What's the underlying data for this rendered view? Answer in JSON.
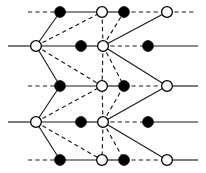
{
  "figure": {
    "width": 206,
    "height": 173,
    "background_color": "#ffffff",
    "line_color": "#1a1a1a",
    "filled_node_color": "#000000",
    "open_node_color": "#ffffff"
  },
  "chart_data": {
    "type": "diagram",
    "subtype": "graph-lattice",
    "grid": false,
    "legend": null,
    "node_radius_filled": 5.4,
    "node_radius_open": 5.4,
    "rows_y": [
      12,
      46,
      86,
      122,
      160
    ],
    "columns_x": [
      36,
      60,
      102,
      124,
      167
    ],
    "nodes": [
      {
        "id": "n1",
        "x": 60,
        "y": 12,
        "type": "filled"
      },
      {
        "id": "n2",
        "x": 102,
        "y": 12,
        "type": "open"
      },
      {
        "id": "n3",
        "x": 124,
        "y": 12,
        "type": "filled"
      },
      {
        "id": "n4",
        "x": 167,
        "y": 12,
        "type": "open"
      },
      {
        "id": "n5",
        "x": 36,
        "y": 46,
        "type": "open"
      },
      {
        "id": "n6",
        "x": 81,
        "y": 46,
        "type": "filled"
      },
      {
        "id": "n7",
        "x": 103,
        "y": 46,
        "type": "open"
      },
      {
        "id": "n8",
        "x": 148,
        "y": 46,
        "type": "filled"
      },
      {
        "id": "n9",
        "x": 60,
        "y": 86,
        "type": "filled"
      },
      {
        "id": "n10",
        "x": 102,
        "y": 86,
        "type": "open"
      },
      {
        "id": "n11",
        "x": 124,
        "y": 86,
        "type": "filled"
      },
      {
        "id": "n12",
        "x": 167,
        "y": 86,
        "type": "open"
      },
      {
        "id": "n13",
        "x": 36,
        "y": 122,
        "type": "open"
      },
      {
        "id": "n14",
        "x": 81,
        "y": 122,
        "type": "filled"
      },
      {
        "id": "n15",
        "x": 103,
        "y": 122,
        "type": "open"
      },
      {
        "id": "n16",
        "x": 148,
        "y": 122,
        "type": "filled"
      },
      {
        "id": "n17",
        "x": 60,
        "y": 160,
        "type": "filled"
      },
      {
        "id": "n18",
        "x": 102,
        "y": 160,
        "type": "open"
      },
      {
        "id": "n19",
        "x": 124,
        "y": 160,
        "type": "filled"
      },
      {
        "id": "n20",
        "x": 167,
        "y": 160,
        "type": "open"
      }
    ],
    "edges": [
      {
        "x1": 28,
        "y1": 12,
        "x2": 60,
        "y2": 12,
        "style": "dashed"
      },
      {
        "x1": 60,
        "y1": 12,
        "x2": 102,
        "y2": 12,
        "style": "solid"
      },
      {
        "x1": 102,
        "y1": 12,
        "x2": 124,
        "y2": 12,
        "style": "solid"
      },
      {
        "x1": 124,
        "y1": 12,
        "x2": 167,
        "y2": 12,
        "style": "dashed"
      },
      {
        "x1": 167,
        "y1": 12,
        "x2": 196,
        "y2": 12,
        "style": "dashed"
      },
      {
        "x1": 8,
        "y1": 46,
        "x2": 36,
        "y2": 46,
        "style": "solid"
      },
      {
        "x1": 36,
        "y1": 46,
        "x2": 81,
        "y2": 46,
        "style": "solid"
      },
      {
        "x1": 81,
        "y1": 46,
        "x2": 103,
        "y2": 46,
        "style": "solid"
      },
      {
        "x1": 103,
        "y1": 46,
        "x2": 148,
        "y2": 46,
        "style": "dashed"
      },
      {
        "x1": 148,
        "y1": 46,
        "x2": 198,
        "y2": 46,
        "style": "solid"
      },
      {
        "x1": 28,
        "y1": 86,
        "x2": 60,
        "y2": 86,
        "style": "dashed"
      },
      {
        "x1": 60,
        "y1": 86,
        "x2": 102,
        "y2": 86,
        "style": "solid"
      },
      {
        "x1": 102,
        "y1": 86,
        "x2": 124,
        "y2": 86,
        "style": "solid"
      },
      {
        "x1": 124,
        "y1": 86,
        "x2": 167,
        "y2": 86,
        "style": "dashed"
      },
      {
        "x1": 167,
        "y1": 86,
        "x2": 198,
        "y2": 86,
        "style": "solid"
      },
      {
        "x1": 8,
        "y1": 122,
        "x2": 36,
        "y2": 122,
        "style": "solid"
      },
      {
        "x1": 36,
        "y1": 122,
        "x2": 81,
        "y2": 122,
        "style": "solid"
      },
      {
        "x1": 81,
        "y1": 122,
        "x2": 103,
        "y2": 122,
        "style": "solid"
      },
      {
        "x1": 103,
        "y1": 122,
        "x2": 148,
        "y2": 122,
        "style": "dashed"
      },
      {
        "x1": 148,
        "y1": 122,
        "x2": 198,
        "y2": 122,
        "style": "solid"
      },
      {
        "x1": 28,
        "y1": 160,
        "x2": 60,
        "y2": 160,
        "style": "dashed"
      },
      {
        "x1": 60,
        "y1": 160,
        "x2": 102,
        "y2": 160,
        "style": "solid"
      },
      {
        "x1": 102,
        "y1": 160,
        "x2": 124,
        "y2": 160,
        "style": "solid"
      },
      {
        "x1": 124,
        "y1": 160,
        "x2": 167,
        "y2": 160,
        "style": "dashed"
      },
      {
        "x1": 167,
        "y1": 160,
        "x2": 198,
        "y2": 160,
        "style": "solid"
      },
      {
        "x1": 36,
        "y1": 46,
        "x2": 60,
        "y2": 12,
        "style": "solid"
      },
      {
        "x1": 36,
        "y1": 46,
        "x2": 102,
        "y2": 12,
        "style": "dashed"
      },
      {
        "x1": 36,
        "y1": 46,
        "x2": 60,
        "y2": 86,
        "style": "solid"
      },
      {
        "x1": 36,
        "y1": 46,
        "x2": 102,
        "y2": 86,
        "style": "dashed"
      },
      {
        "x1": 103,
        "y1": 46,
        "x2": 102,
        "y2": 12,
        "style": "dashed"
      },
      {
        "x1": 103,
        "y1": 46,
        "x2": 124,
        "y2": 12,
        "style": "dashed"
      },
      {
        "x1": 103,
        "y1": 46,
        "x2": 167,
        "y2": 12,
        "style": "solid"
      },
      {
        "x1": 103,
        "y1": 46,
        "x2": 102,
        "y2": 86,
        "style": "dashed"
      },
      {
        "x1": 103,
        "y1": 46,
        "x2": 124,
        "y2": 86,
        "style": "dashed"
      },
      {
        "x1": 103,
        "y1": 46,
        "x2": 167,
        "y2": 86,
        "style": "solid"
      },
      {
        "x1": 36,
        "y1": 122,
        "x2": 60,
        "y2": 86,
        "style": "solid"
      },
      {
        "x1": 36,
        "y1": 122,
        "x2": 102,
        "y2": 86,
        "style": "dashed"
      },
      {
        "x1": 36,
        "y1": 122,
        "x2": 60,
        "y2": 160,
        "style": "solid"
      },
      {
        "x1": 36,
        "y1": 122,
        "x2": 102,
        "y2": 160,
        "style": "dashed"
      },
      {
        "x1": 103,
        "y1": 122,
        "x2": 102,
        "y2": 86,
        "style": "dashed"
      },
      {
        "x1": 103,
        "y1": 122,
        "x2": 124,
        "y2": 86,
        "style": "dashed"
      },
      {
        "x1": 103,
        "y1": 122,
        "x2": 167,
        "y2": 86,
        "style": "solid"
      },
      {
        "x1": 103,
        "y1": 122,
        "x2": 102,
        "y2": 160,
        "style": "dashed"
      },
      {
        "x1": 103,
        "y1": 122,
        "x2": 124,
        "y2": 160,
        "style": "dashed"
      },
      {
        "x1": 103,
        "y1": 122,
        "x2": 167,
        "y2": 160,
        "style": "solid"
      }
    ]
  }
}
